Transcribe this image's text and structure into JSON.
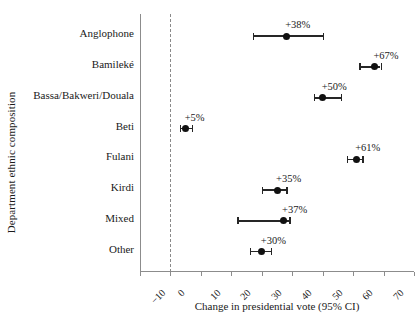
{
  "chart_data": {
    "type": "scatter",
    "title": "",
    "xlabel": "Change in presidential vote (95% CI)",
    "ylabel": "Department ethnic composition",
    "xlim": [
      -10,
      80
    ],
    "xticks": [
      -10,
      0,
      10,
      20,
      30,
      40,
      50,
      60,
      70,
      80
    ],
    "xticklabels": [
      "−10",
      "0",
      "10",
      "20",
      "30",
      "40",
      "50",
      "60",
      "70",
      "80"
    ],
    "grid": false,
    "legend": null,
    "reference_line": 0,
    "categories": [
      "Anglophone",
      "Bamileké",
      "Bassa/Bakweri/Douala",
      "Beti",
      "Fulani",
      "Kirdi",
      "Mixed",
      "Other"
    ],
    "values": [
      38,
      67,
      50,
      5,
      61,
      35,
      37,
      30
    ],
    "ci_low": [
      27,
      62,
      47,
      3,
      58,
      30,
      22,
      26
    ],
    "ci_high": [
      50,
      69,
      56,
      7,
      63,
      38,
      39,
      33
    ],
    "point_labels": [
      "+38%",
      "+67%",
      "+50%",
      "+5%",
      "+61%",
      "+35%",
      "+37%",
      "+30%"
    ]
  }
}
